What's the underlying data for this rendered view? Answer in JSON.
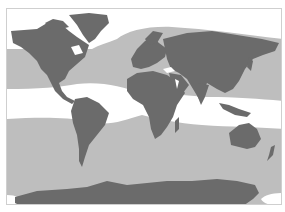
{
  "map": {
    "type": "world-map-zones",
    "projection": "equirectangular-like",
    "colors": {
      "land": "#6b6b6b",
      "zone_gray": "#bebebe",
      "zone_white": "#ffffff",
      "border": "#cfcfcf"
    },
    "zones": [
      {
        "name": "northern-polar-zone",
        "fill": "white"
      },
      {
        "name": "northern-temperate-ocean-zone",
        "fill": "gray"
      },
      {
        "name": "tropical-band-zone",
        "fill": "white"
      },
      {
        "name": "southern-temperate-ocean-zone",
        "fill": "gray"
      },
      {
        "name": "southern-polar-corner-zones",
        "fill": "white"
      }
    ],
    "continents": [
      "North America",
      "Greenland",
      "South America",
      "Europe",
      "Africa",
      "Asia",
      "Australia",
      "Antarctica",
      "New Zealand"
    ]
  }
}
